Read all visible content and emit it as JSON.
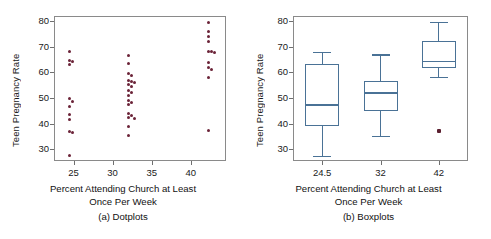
{
  "figure": {
    "panel_a": {
      "caption": "(a) Dotplots",
      "ylabel": "Teen Pregnancy Rate",
      "xlabel_line1": "Percent Attending Church at Least",
      "xlabel_line2": "Once Per Week"
    },
    "panel_b": {
      "caption": "(b) Boxplots",
      "ylabel": "Teen Pregnancy Rate",
      "xlabel_line1": "Percent Attending Church at Least",
      "xlabel_line2": "Once Per Week"
    },
    "colors": {
      "dot": "#6b2338",
      "box": "#4a7296",
      "axis": "#8a8a8a",
      "text": "#111111"
    }
  },
  "chart_data": [
    {
      "type": "scatter",
      "panel": "a",
      "title": "(a) Dotplots",
      "xlabel": "Percent Attending Church at Least Once Per Week",
      "ylabel": "Teen Pregnancy Rate",
      "xlim": [
        22.5,
        44.5
      ],
      "ylim": [
        25.5,
        82
      ],
      "xticks": [
        25,
        30,
        35,
        40
      ],
      "yticks": [
        30,
        40,
        50,
        60,
        70,
        80
      ],
      "grid": false,
      "legend": null,
      "groups": [
        {
          "name": "24.5",
          "x": 24.5,
          "values": [
            68.0,
            64.8,
            64.2,
            63.0,
            49.8,
            48.8,
            46.8,
            43.5,
            41.5,
            37.0,
            36.8,
            27.8
          ]
        },
        {
          "name": "32",
          "x": 32.0,
          "values": [
            66.5,
            63.5,
            59.5,
            58.8,
            57.0,
            56.5,
            56.0,
            55.5,
            54.5,
            53.0,
            52.0,
            51.0,
            49.0,
            48.2,
            47.5,
            44.0,
            43.2,
            42.5,
            42.0,
            38.8,
            35.5
          ]
        },
        {
          "name": "42",
          "x": 42.3,
          "values": [
            79.5,
            76.0,
            74.0,
            72.2,
            68.2,
            68.0,
            67.8,
            64.0,
            62.0,
            61.2,
            58.2,
            37.2
          ]
        }
      ]
    },
    {
      "type": "box",
      "panel": "b",
      "title": "(b) Boxplots",
      "xlabel": "Percent Attending Church at Least Once Per Week",
      "ylabel": "Teen Pregnancy Rate",
      "ylim": [
        25.5,
        82
      ],
      "yticks": [
        30,
        40,
        50,
        60,
        70,
        80
      ],
      "grid": false,
      "legend": null,
      "categories": [
        "24.5",
        "32",
        "42"
      ],
      "boxes": [
        {
          "category": "24.5",
          "whisker_low": 27.5,
          "q1": 39.0,
          "median": 47.6,
          "q3": 63.4,
          "whisker_high": 68.0,
          "outliers": []
        },
        {
          "category": "32",
          "whisker_low": 35.4,
          "q1": 45.0,
          "median": 52.2,
          "q3": 56.8,
          "whisker_high": 67.0,
          "outliers": []
        },
        {
          "category": "42",
          "whisker_low": 58.4,
          "q1": 61.6,
          "median": 64.6,
          "q3": 72.4,
          "whisker_high": 79.8,
          "outliers": [
            37.2
          ]
        }
      ]
    }
  ]
}
